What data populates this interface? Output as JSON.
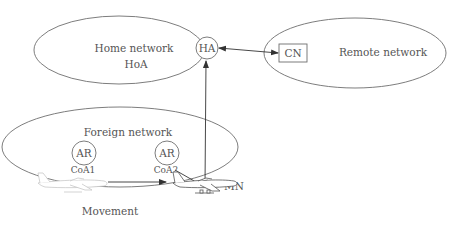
{
  "diagram": {
    "type": "mobile-ip-handover",
    "colors": {
      "stroke": "#6e6e6e",
      "text": "#555555",
      "faded": "#c8c8c8",
      "background": "#ffffff"
    },
    "networks": {
      "home": {
        "label": "Home network",
        "sublabel": "HoA"
      },
      "remote": {
        "label": "Remote network"
      },
      "foreign": {
        "label": "Foreign network"
      }
    },
    "nodes": {
      "ha": {
        "label": "HA"
      },
      "cn": {
        "label": "CN"
      },
      "ar1": {
        "label": "AR",
        "address": "CoA1"
      },
      "ar2": {
        "label": "AR",
        "address": "CoA2"
      },
      "mn": {
        "label": "MN"
      }
    },
    "movement": {
      "label": "Movement"
    }
  }
}
